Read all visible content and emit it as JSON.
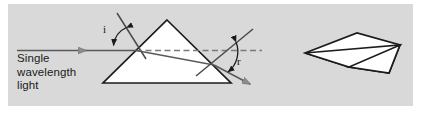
{
  "figure": {
    "name": "refraction-through-prism-diagram",
    "type": "physics-optics-diagram",
    "panel_background_color": "#d9d9d9",
    "page_background_color": "#ffffff"
  },
  "labels": {
    "source_caption": "Single\nwavelength\nlight",
    "angle_of_incidence": "i",
    "angle_of_refraction": "r"
  },
  "elements": {
    "incident_ray_name": "incident-ray",
    "normal_entry_name": "normal-line-entry",
    "normal_exit_name": "normal-line-exit",
    "internal_ray_name": "internal-refracted-ray",
    "emergent_ray_name": "emergent-ray",
    "prism_2d_name": "triangular-prism-cross-section",
    "prism_3d_name": "triangular-prism-3d"
  },
  "colors": {
    "ray_stroke": "#5a5a5a",
    "normal_stroke": "#4a4a4a",
    "prism_outline": "#1c1c1c",
    "prism_fill": "#ffffff",
    "arrow_fill": "#8c8c8c",
    "dashed_normal": "#7a7a7a",
    "text": "#1a1a1a"
  }
}
